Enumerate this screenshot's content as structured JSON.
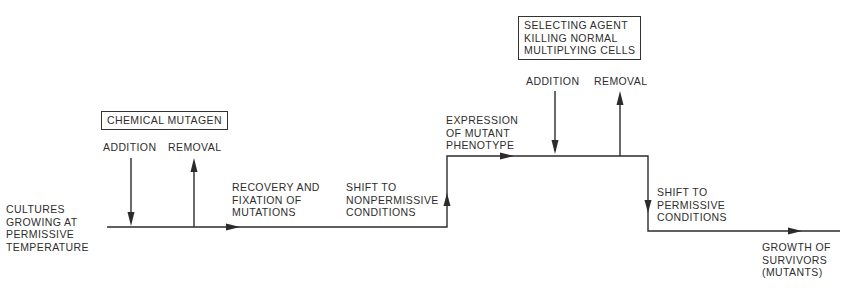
{
  "diagram": {
    "stages": {
      "start": [
        "CULTURES",
        "GROWING AT",
        "PERMISSIVE",
        "TEMPERATURE"
      ],
      "recovery": [
        "RECOVERY AND",
        "FIXATION OF",
        "MUTATIONS"
      ],
      "shift_nonpermissive": [
        "SHIFT TO",
        "NONPERMISSIVE",
        "CONDITIONS"
      ],
      "expression": [
        "EXPRESSION",
        "OF MUTANT",
        "PHENOTYPE"
      ],
      "shift_permissive": [
        "SHIFT TO",
        "PERMISSIVE",
        "CONDITIONS"
      ],
      "growth": [
        "GROWTH OF",
        "SURVIVORS",
        "(MUTANTS)"
      ]
    },
    "mutagen_box": "CHEMICAL MUTAGEN",
    "mutagen_addition": "ADDITION",
    "mutagen_removal": "REMOVAL",
    "selecting_box": [
      "SELECTING AGENT",
      "KILLING NORMAL",
      "MULTIPLYING CELLS"
    ],
    "selecting_addition": "ADDITION",
    "selecting_removal": "REMOVAL"
  }
}
